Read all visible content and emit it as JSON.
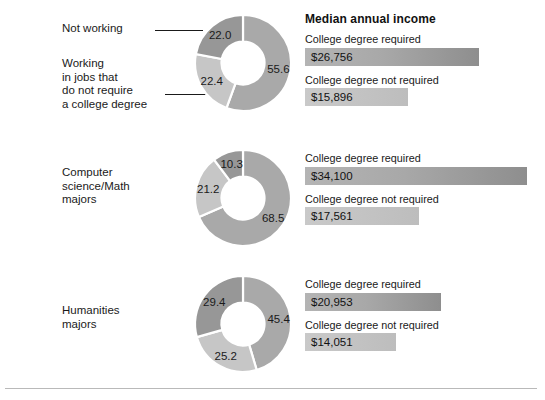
{
  "chart_data": [
    {
      "type": "pie",
      "title": "All college graduates",
      "categories": [
        "Working in jobs that require a college degree",
        "Not working",
        "Working in jobs that do not require a college degree"
      ],
      "values": [
        55.6,
        22.4,
        22.0
      ],
      "labels": [
        "55.6",
        "22.4",
        "22.0"
      ],
      "units": "percent"
    },
    {
      "type": "pie",
      "title": "Computer science/Math majors",
      "categories": [
        "Working in jobs that require a college degree",
        "Not working",
        "Working in jobs that do not require a college degree"
      ],
      "values": [
        68.5,
        21.2,
        10.3
      ],
      "labels": [
        "68.5",
        "21.2",
        "10.3"
      ],
      "units": "percent"
    },
    {
      "type": "pie",
      "title": "Humanities majors",
      "categories": [
        "Working in jobs that require a college degree",
        "Not working",
        "Working in jobs that do not require a college degree"
      ],
      "values": [
        45.4,
        25.2,
        29.4
      ],
      "labels": [
        "45.4",
        "25.2",
        "29.4"
      ],
      "units": "percent"
    },
    {
      "type": "bar",
      "title": "Median annual income",
      "orientation": "horizontal",
      "categories": [
        "All graduates — College degree required",
        "All graduates — College degree not required",
        "Computer science/Math — College degree required",
        "Computer science/Math — College degree not required",
        "Humanities — College degree required",
        "Humanities — College degree not required"
      ],
      "values": [
        26756,
        15896,
        34100,
        17561,
        20953,
        14051
      ],
      "value_labels": [
        "$26,756",
        "$15,896",
        "$34,100",
        "$17,561",
        "$20,953",
        "$14,051"
      ],
      "xlim": [
        0,
        34100
      ],
      "ylabel": "",
      "xlabel": "Median annual income (US$)",
      "grid": false,
      "legend": false
    }
  ],
  "rows": [
    {
      "group_label": "",
      "callouts": [
        {
          "text": "Not working"
        },
        {
          "text": "Working\nin jobs that\ndo not require\na college degree"
        }
      ],
      "donut": {
        "slices": [
          {
            "label": "55.6",
            "value": 55.6,
            "shade": "mid"
          },
          {
            "label": "22.4",
            "value": 22.4,
            "shade": "light"
          },
          {
            "label": "22.0",
            "value": 22.0,
            "shade": "dark"
          }
        ]
      },
      "bars_title": "Median annual income",
      "bars": [
        {
          "caption": "College degree required",
          "value_label": "$26,756",
          "value": 26756,
          "shade": "dark"
        },
        {
          "caption": "College degree not required",
          "value_label": "$15,896",
          "value": 15896,
          "shade": "light"
        }
      ]
    },
    {
      "group_label": "Computer\nscience/Math\nmajors",
      "callouts": [],
      "donut": {
        "slices": [
          {
            "label": "68.5",
            "value": 68.5,
            "shade": "mid"
          },
          {
            "label": "21.2",
            "value": 21.2,
            "shade": "light"
          },
          {
            "label": "10.3",
            "value": 10.3,
            "shade": "dark"
          }
        ]
      },
      "bars_title": "",
      "bars": [
        {
          "caption": "College degree required",
          "value_label": "$34,100",
          "value": 34100,
          "shade": "dark"
        },
        {
          "caption": "College degree not required",
          "value_label": "$17,561",
          "value": 17561,
          "shade": "light"
        }
      ]
    },
    {
      "group_label": "Humanities\nmajors",
      "callouts": [],
      "donut": {
        "slices": [
          {
            "label": "45.4",
            "value": 45.4,
            "shade": "mid"
          },
          {
            "label": "25.2",
            "value": 25.2,
            "shade": "light"
          },
          {
            "label": "29.4",
            "value": 29.4,
            "shade": "dark"
          }
        ]
      },
      "bars_title": "",
      "bars": [
        {
          "caption": "College degree required",
          "value_label": "$20,953",
          "value": 20953,
          "shade": "dark"
        },
        {
          "caption": "College degree not required",
          "value_label": "$14,051",
          "value": 14051,
          "shade": "light"
        }
      ]
    }
  ],
  "colors": {
    "slice_mid": "#a9a9a9",
    "slice_light": "#c6c6c6",
    "slice_dark": "#979797",
    "bar_dark": "#a8a8a8",
    "bar_light": "#c4c4c4",
    "text": "#1a1a1a",
    "rule": "#b9b9b9",
    "background": "#ffffff"
  },
  "layout": {
    "bar_max_px": 222,
    "bar_max_value": 34100
  }
}
